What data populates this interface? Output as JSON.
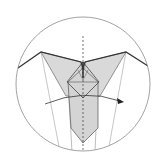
{
  "diagram": {
    "type": "origami-fold-step",
    "colors": {
      "background": "#ffffff",
      "paper_fill": "#d9d9d9",
      "edge": "#3a3a3a",
      "thin_line": "#9a9a9a",
      "circle": "#888888",
      "arrow": "#222222"
    },
    "elements": {
      "magnify_circle": "detail-circle",
      "center_line": "dashed-valley-fold-line",
      "arrow": "curved-fold-arrow-right"
    }
  }
}
